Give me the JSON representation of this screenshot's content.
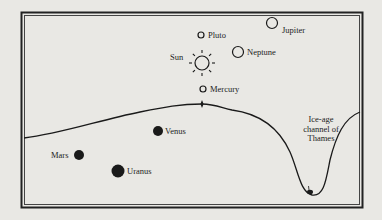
{
  "diagram": {
    "background": "#e9e8e4",
    "ink": "#1a1a1a",
    "bodies": [
      {
        "name": "Jupiter",
        "label": "Jupiter",
        "style": "hollow",
        "cx": 272,
        "cy": 23,
        "r": 5.5,
        "label_x": 282,
        "label_y": 33
      },
      {
        "name": "Pluto",
        "label": "Pluto",
        "style": "hollow",
        "cx": 201,
        "cy": 35,
        "r": 3,
        "label_x": 208,
        "label_y": 38
      },
      {
        "name": "Neptune",
        "label": "Neptune",
        "style": "hollow",
        "cx": 238,
        "cy": 52,
        "r": 5.5,
        "label_x": 247,
        "label_y": 55
      },
      {
        "name": "Sun",
        "label": "Sun",
        "style": "sun",
        "cx": 202,
        "cy": 63,
        "r": 7,
        "label_x": 170,
        "label_y": 60
      },
      {
        "name": "Mercury",
        "label": "Mercury",
        "style": "hollow",
        "cx": 203,
        "cy": 89,
        "r": 3,
        "label_x": 210,
        "label_y": 92
      },
      {
        "name": "Venus",
        "label": "Venus",
        "style": "filled",
        "cx": 158,
        "cy": 131,
        "r": 5,
        "label_x": 165,
        "label_y": 134
      },
      {
        "name": "Mars",
        "label": "Mars",
        "style": "filled",
        "cx": 79,
        "cy": 155,
        "r": 5,
        "label_x": 51,
        "label_y": 158
      },
      {
        "name": "Uranus",
        "label": "Uranus",
        "style": "filled",
        "cx": 118,
        "cy": 171,
        "r": 6.5,
        "label_x": 127,
        "label_y": 174
      }
    ],
    "annotation": {
      "lines": [
        "Ice-age",
        "channel of",
        "Thames"
      ],
      "x": 321,
      "y": 122
    },
    "ground_profile": "M24,138 C60,134 100,120 140,112 C165,107 180,104 202,104 C215,104 222,108 232,110 C262,114 280,130 290,152 C298,170 300,192 312,195 C324,197 326,180 330,160 C336,136 344,118 360,112",
    "landmark_marker": {
      "x": 202,
      "y": 104
    },
    "channel_figure": {
      "x": 310,
      "y": 192
    }
  }
}
